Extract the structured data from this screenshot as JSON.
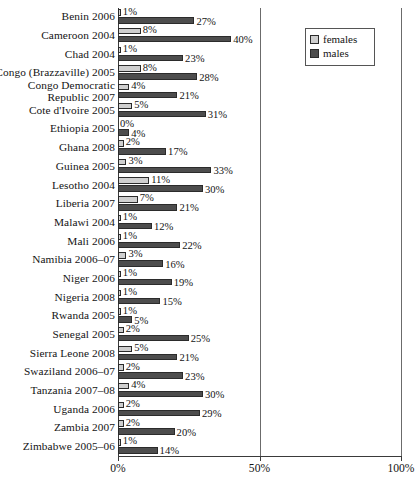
{
  "chart_data": {
    "type": "bar",
    "orientation": "horizontal",
    "title": "",
    "subtitle": "",
    "xlabel": "",
    "ylabel": "",
    "xlim": [
      0,
      100
    ],
    "xticks": [
      "0%",
      "50%",
      "100%"
    ],
    "xtick_values": [
      0,
      50,
      100
    ],
    "grid": false,
    "legend_position": "top-right",
    "value_label_suffix": "%",
    "categories": [
      "Benin 2006",
      "Cameroon 2004",
      "Chad 2004",
      "Congo (Brazzaville) 2005",
      "Congo Democratic Republic 2007",
      "Cote d'Ivoire 2005",
      "Ethiopia 2005",
      "Ghana 2008",
      "Guinea 2005",
      "Lesotho 2004",
      "Liberia 2007",
      "Malawi 2004",
      "Mali 2006",
      "Namibia 2006–07",
      "Niger 2006",
      "Nigeria 2008",
      "Rwanda 2005",
      "Senegal 2005",
      "Sierra Leone 2008",
      "Swaziland 2006–07",
      "Tanzania 2007–08",
      "Uganda 2006",
      "Zambia 2007",
      "Zimbabwe 2005–06"
    ],
    "category_lines": [
      [
        "Benin 2006"
      ],
      [
        "Cameroon 2004"
      ],
      [
        "Chad 2004"
      ],
      [
        "Congo (Brazzaville) 2005"
      ],
      [
        "Congo Democratic",
        "Republic 2007"
      ],
      [
        "Cote d'Ivoire 2005"
      ],
      [
        "Ethiopia 2005"
      ],
      [
        "Ghana 2008"
      ],
      [
        "Guinea 2005"
      ],
      [
        "Lesotho 2004"
      ],
      [
        "Liberia 2007"
      ],
      [
        "Malawi 2004"
      ],
      [
        "Mali 2006"
      ],
      [
        "Namibia 2006–07"
      ],
      [
        "Niger 2006"
      ],
      [
        "Nigeria 2008"
      ],
      [
        "Rwanda 2005"
      ],
      [
        "Senegal 2005"
      ],
      [
        "Sierra Leone 2008"
      ],
      [
        "Swaziland 2006–07"
      ],
      [
        "Tanzania 2007–08"
      ],
      [
        "Uganda 2006"
      ],
      [
        "Zambia 2007"
      ],
      [
        "Zimbabwe 2005–06"
      ]
    ],
    "series": [
      {
        "name": "females",
        "color": "#cfcfcf",
        "values": [
          1,
          8,
          1,
          8,
          4,
          5,
          0,
          2,
          3,
          11,
          7,
          1,
          1,
          3,
          1,
          1,
          1,
          2,
          5,
          2,
          4,
          2,
          2,
          1
        ],
        "labels": [
          "1%",
          "8%",
          "1%",
          "8%",
          "4%",
          "5%",
          "0%",
          "2%",
          "3%",
          "11%",
          "7%",
          "1%",
          "1%",
          "3%",
          "1%",
          "1%",
          "1%",
          "2%",
          "5%",
          "2%",
          "4%",
          "2%",
          "2%",
          "1%"
        ]
      },
      {
        "name": "males",
        "color": "#4d4d4d",
        "values": [
          27,
          40,
          23,
          28,
          21,
          31,
          4,
          17,
          33,
          30,
          21,
          12,
          22,
          16,
          19,
          15,
          5,
          25,
          21,
          23,
          30,
          29,
          20,
          14
        ],
        "labels": [
          "27%",
          "40%",
          "23%",
          "28%",
          "21%",
          "31%",
          "4%",
          "17%",
          "33%",
          "30%",
          "21%",
          "12%",
          "22%",
          "16%",
          "19%",
          "15%",
          "5%",
          "25%",
          "21%",
          "23%",
          "30%",
          "29%",
          "20%",
          "14%"
        ]
      }
    ]
  },
  "legend": {
    "items": [
      {
        "label": "females",
        "color": "#cfcfcf"
      },
      {
        "label": "males",
        "color": "#4d4d4d"
      }
    ]
  }
}
